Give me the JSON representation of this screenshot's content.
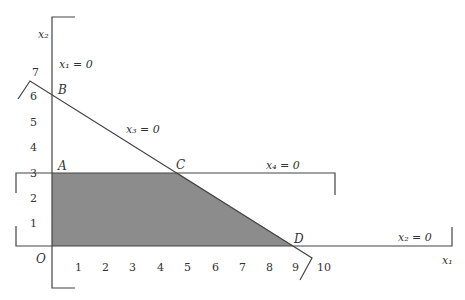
{
  "diagram": {
    "type": "linear-programming-feasible-region",
    "axes": {
      "x_label": "x₁",
      "y_label": "x₂",
      "origin_label": "O",
      "x_ticks": [
        "1",
        "2",
        "3",
        "4",
        "5",
        "6",
        "7",
        "8",
        "9",
        "10"
      ],
      "y_ticks": [
        "1",
        "2",
        "3",
        "4",
        "5",
        "6",
        "7"
      ]
    },
    "points": {
      "A": {
        "label": "A",
        "x": 0,
        "y": 3
      },
      "B": {
        "label": "B",
        "x": 0,
        "y": 6
      },
      "C": {
        "label": "C",
        "x": 4.5,
        "y": 3
      },
      "D": {
        "label": "D",
        "x": 9,
        "y": 0
      }
    },
    "constraint_lines": [
      {
        "label": "x₁ = 0"
      },
      {
        "label": "x₂ = 0"
      },
      {
        "label": "x₃ = 0"
      },
      {
        "label": "x₄ = 0"
      }
    ],
    "region": {
      "vertices": [
        "O",
        "A",
        "C",
        "D"
      ],
      "fill": "#8c8c8c"
    },
    "colors": {
      "line": "#444444",
      "fill": "#8c8c8c"
    }
  }
}
